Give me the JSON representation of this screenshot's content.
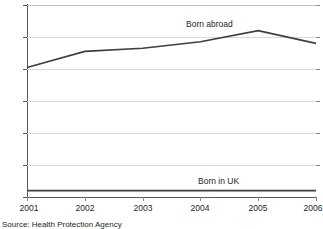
{
  "chart_data": {
    "type": "line",
    "title": "",
    "subtitle": "",
    "xlabel": "",
    "ylabel": "",
    "x": [
      "2001",
      "2002",
      "2003",
      "2004",
      "2005",
      "2006"
    ],
    "xtick_labels": [
      "2001",
      "2002",
      "2003",
      "2004",
      "2005",
      "2006"
    ],
    "ytick_labels": [
      "0",
      "20",
      "40",
      "60",
      "80",
      "100",
      "120"
    ],
    "ytick_values": [
      0,
      20,
      40,
      60,
      80,
      100,
      120
    ],
    "ylim": [
      0,
      120
    ],
    "xlim": [
      "2001",
      "2006"
    ],
    "grid": true,
    "grid_axis": "y",
    "legend": "inline-labels",
    "series": [
      {
        "name": "Born abroad",
        "values": [
          81,
          91,
          93,
          97,
          104,
          96
        ],
        "color": "#3f3f3f",
        "label_text": "Born abroad"
      },
      {
        "name": "Born in UK",
        "values": [
          4,
          4,
          4,
          4,
          4,
          4
        ],
        "color": "#3f3f3f",
        "label_text": "Born in UK"
      }
    ],
    "annotations": [
      {
        "name": "born-abroad-label",
        "text": "Born abroad"
      },
      {
        "name": "born-in-uk-label",
        "text": "Born in UK"
      }
    ],
    "source": "Source: Health Protection Agency"
  },
  "figure": {
    "source_note": "Source: Health Protection Agency",
    "grid_color": "#d9d9d9",
    "axis_color": "#58595b",
    "line_color": "#3f3f3f",
    "background": "#ffffff"
  }
}
